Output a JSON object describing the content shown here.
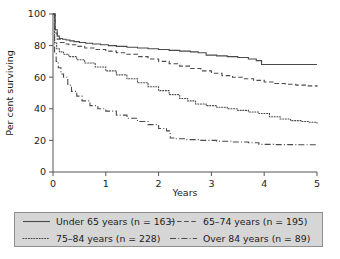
{
  "chart_data": {
    "type": "line",
    "title": "",
    "xlabel": "Years",
    "ylabel": "Per cent surviving",
    "xlim": [
      0,
      5
    ],
    "ylim": [
      0,
      100
    ],
    "xticks": [
      "0",
      "1",
      "2",
      "3",
      "4",
      "5"
    ],
    "yticks": [
      "0",
      "20",
      "40",
      "60",
      "80",
      "100"
    ],
    "grid": false,
    "legend_position": "below-axes",
    "series": [
      {
        "name": "Under 65 years (n = 163)",
        "label_text": "Under 65 years",
        "n": 163,
        "style": "solid",
        "x": [
          0,
          0.04,
          0.08,
          0.12,
          0.18,
          0.25,
          0.32,
          0.4,
          0.5,
          0.62,
          0.75,
          0.9,
          1.05,
          1.2,
          1.4,
          1.6,
          1.8,
          2.0,
          2.2,
          2.4,
          2.6,
          2.75,
          2.9,
          3.1,
          3.3,
          3.5,
          3.7,
          3.85,
          3.95,
          4.2,
          4.5,
          5.0
        ],
        "y": [
          100,
          90,
          86,
          84.5,
          84,
          83.5,
          83,
          82.5,
          82,
          81.5,
          81,
          80.5,
          80,
          79.5,
          79,
          78.5,
          78,
          77.5,
          77,
          76.5,
          76,
          75.5,
          74,
          73.5,
          73,
          72.5,
          71.5,
          70.5,
          68,
          68,
          68,
          68
        ]
      },
      {
        "name": "65-74 years (n = 195)",
        "label_text": "65–74 years",
        "n": 195,
        "style": "dashed",
        "x": [
          0,
          0.04,
          0.08,
          0.14,
          0.22,
          0.3,
          0.45,
          0.6,
          0.8,
          1.0,
          1.2,
          1.4,
          1.6,
          1.8,
          2.0,
          2.2,
          2.4,
          2.6,
          2.8,
          3.0,
          3.2,
          3.4,
          3.6,
          3.8,
          4.0,
          4.2,
          4.4,
          4.6,
          4.8,
          5.0
        ],
        "y": [
          100,
          88,
          84,
          82,
          81,
          80.5,
          79.5,
          78.5,
          77.5,
          76.5,
          75.5,
          74.5,
          73,
          71.5,
          70,
          68.5,
          67,
          65.5,
          64,
          62.5,
          61,
          60,
          59,
          58,
          57,
          56,
          55.5,
          55,
          54.5,
          54
        ]
      },
      {
        "name": "75-84 years (n = 228)",
        "label_text": "75–84 years",
        "n": 228,
        "style": "dotted",
        "x": [
          0,
          0.03,
          0.07,
          0.12,
          0.2,
          0.3,
          0.45,
          0.6,
          0.8,
          1.0,
          1.2,
          1.4,
          1.6,
          1.8,
          2.0,
          2.2,
          2.4,
          2.55,
          2.7,
          2.9,
          3.1,
          3.3,
          3.5,
          3.7,
          3.9,
          4.1,
          4.3,
          4.5,
          4.7,
          4.85,
          5.0
        ],
        "y": [
          100,
          82,
          78,
          76,
          74.5,
          73,
          71,
          69,
          66.5,
          64,
          61.5,
          59,
          56.5,
          54,
          51.5,
          49,
          46.5,
          45,
          43,
          42,
          41,
          40,
          39,
          38,
          37,
          35,
          33.5,
          32.5,
          32,
          31.5,
          31
        ]
      },
      {
        "name": "Over 84 years (n = 89)",
        "label_text": "Over 84 years",
        "n": 89,
        "style": "dashdot",
        "x": [
          0,
          0.03,
          0.06,
          0.1,
          0.15,
          0.2,
          0.28,
          0.35,
          0.45,
          0.55,
          0.7,
          0.85,
          1.0,
          1.2,
          1.4,
          1.6,
          1.8,
          2.0,
          2.15,
          2.22,
          2.3,
          2.5,
          2.8,
          3.1,
          3.4,
          3.7,
          3.9,
          4.2,
          4.6,
          5.0
        ],
        "y": [
          100,
          75,
          70,
          66,
          62,
          60,
          55,
          51,
          48,
          45,
          42,
          40,
          38.5,
          36,
          34,
          32,
          30,
          27.5,
          26,
          21.5,
          21,
          20.5,
          20,
          19.5,
          19,
          18.5,
          17.5,
          17.3,
          17.2,
          17
        ]
      }
    ]
  },
  "legend": {
    "items": [
      {
        "label": "Under 65 years (n = 163)",
        "text_main": "Under 65 years (",
        "n_value": "n",
        "text_tail": " = 163)",
        "style": "solid"
      },
      {
        "label": "65–74 years (n = 195)",
        "text_main": "65–74 years (",
        "n_value": "n",
        "text_tail": " = 195)",
        "style": "dashed"
      },
      {
        "label": "75–84 years (n = 228)",
        "text_main": "75–84 years (",
        "n_value": "n",
        "text_tail": " = 228)",
        "style": "dotted"
      },
      {
        "label": "Over 84 years (n = 89)",
        "text_main": "Over 84 years (",
        "n_value": "n",
        "text_tail": " = 89)",
        "style": "dashdot"
      }
    ]
  },
  "colors": {
    "curve": "#4a4a4a",
    "axis": "#555555",
    "legend_bg": "#d6d6d6",
    "legend_border": "#8f8f8f",
    "text": "#1a1a1a"
  }
}
